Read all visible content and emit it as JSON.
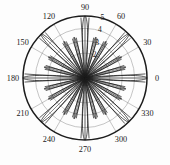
{
  "figure": {
    "title": "",
    "background_color": "#fdfdfd",
    "line_color": "#1c1c1c",
    "grid_color": "#8a8a8a",
    "label_color": "#1a1a1a"
  },
  "chart_data": {
    "type": "line",
    "plot_style": "polar",
    "title": "",
    "subtitle": "",
    "xlabel": "",
    "ylabel": "",
    "grid": true,
    "legend": null,
    "legend_position": "none",
    "angular_axis": {
      "unit": "degrees",
      "range": [
        0,
        360
      ],
      "tick_step": 30,
      "tick_labels": [
        "0",
        "30",
        "60",
        "90",
        "120",
        "150",
        "180",
        "210",
        "240",
        "270",
        "300",
        "330"
      ],
      "tick_values": [
        0,
        30,
        60,
        90,
        120,
        150,
        180,
        210,
        240,
        270,
        300,
        330
      ],
      "direction": "counterclockwise",
      "zero_location": "E"
    },
    "radial_axis": {
      "range": [
        0,
        5
      ],
      "tick_labels": [
        "2",
        "3",
        "4",
        "5"
      ],
      "tick_values": [
        2,
        3,
        4,
        5
      ],
      "label_angle_deg": 78,
      "outer_ring_value": 5
    },
    "series": [
      {
        "name": "major-lobes",
        "lobe_angles_deg": [
          0,
          45,
          90,
          135,
          180,
          225,
          270,
          315
        ],
        "lobe_peak_radius": 5.0,
        "lobe_half_width_deg": 7
      },
      {
        "name": "minor-lobes",
        "lobe_angles_deg": [
          15,
          30,
          60,
          75,
          105,
          120,
          150,
          165,
          195,
          210,
          240,
          255,
          285,
          300,
          330,
          345
        ],
        "lobe_peak_radius": 3.4,
        "lobe_half_width_deg": 5
      }
    ]
  },
  "labels": {
    "angles": [
      {
        "text": "0",
        "deg": 0
      },
      {
        "text": "30",
        "deg": 30
      },
      {
        "text": "60",
        "deg": 60
      },
      {
        "text": "90",
        "deg": 90
      },
      {
        "text": "120",
        "deg": 120
      },
      {
        "text": "150",
        "deg": 150
      },
      {
        "text": "180",
        "deg": 180
      },
      {
        "text": "210",
        "deg": 210
      },
      {
        "text": "240",
        "deg": 240
      },
      {
        "text": "270",
        "deg": 270
      },
      {
        "text": "300",
        "deg": 300
      },
      {
        "text": "330",
        "deg": 330
      }
    ],
    "radii": [
      {
        "text": "2",
        "value": 2
      },
      {
        "text": "3",
        "value": 3
      },
      {
        "text": "4",
        "value": 4
      },
      {
        "text": "5",
        "value": 5
      }
    ]
  }
}
